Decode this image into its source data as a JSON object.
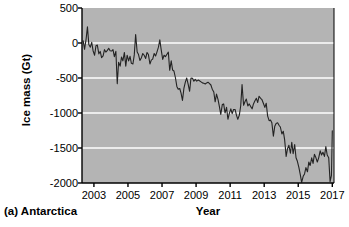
{
  "figure": {
    "caption": "(a) Antarctica",
    "background_color": "#ffffff",
    "plot_background_color": "#b4b4b4",
    "gridline_color": "#ffffff",
    "line_color": "#232323",
    "axis_color": "#000000"
  },
  "chart_data": {
    "type": "line",
    "title": "",
    "subtitle": "",
    "xlabel": "Year",
    "ylabel": "Ice mass (Gt)",
    "xlim": [
      2002.3,
      2017.1
    ],
    "ylim": [
      -2000,
      500
    ],
    "xticks": [
      2003,
      2005,
      2007,
      2009,
      2011,
      2013,
      2015,
      2017
    ],
    "xtick_labels": [
      "2003",
      "2005",
      "2007",
      "2009",
      "2011",
      "2013",
      "2015",
      "2017"
    ],
    "yticks": [
      500,
      0,
      -500,
      -1000,
      -1500,
      -2000
    ],
    "ytick_labels": [
      "500",
      "0",
      "-500",
      "-1000",
      "-1500",
      "-2000"
    ],
    "grid": true,
    "grid_axis": "y",
    "gridlines_at": [
      0,
      -500,
      -1000,
      -1500
    ],
    "legend": null,
    "legend_position": "none",
    "annotations": [
      "(a) Antarctica"
    ],
    "series": [
      {
        "name": "Antarctica ice mass anomaly",
        "units": "Gt",
        "x": [
          2002.37,
          2002.45,
          2002.54,
          2002.62,
          2002.7,
          2002.79,
          2002.87,
          2002.95,
          2003.04,
          2003.12,
          2003.2,
          2003.29,
          2003.37,
          2003.45,
          2003.54,
          2003.62,
          2003.7,
          2003.79,
          2003.87,
          2003.95,
          2004.04,
          2004.12,
          2004.2,
          2004.29,
          2004.37,
          2004.45,
          2004.54,
          2004.62,
          2004.7,
          2004.79,
          2004.87,
          2004.95,
          2005.04,
          2005.12,
          2005.2,
          2005.29,
          2005.37,
          2005.45,
          2005.54,
          2005.62,
          2005.7,
          2005.79,
          2005.87,
          2005.95,
          2006.04,
          2006.12,
          2006.2,
          2006.29,
          2006.37,
          2006.45,
          2006.54,
          2006.62,
          2006.7,
          2006.79,
          2006.87,
          2006.95,
          2007.04,
          2007.12,
          2007.2,
          2007.29,
          2007.37,
          2007.45,
          2007.54,
          2007.62,
          2007.7,
          2007.79,
          2007.87,
          2007.95,
          2008.04,
          2008.12,
          2008.2,
          2008.29,
          2008.37,
          2008.45,
          2008.54,
          2008.62,
          2008.7,
          2008.79,
          2008.87,
          2008.95,
          2009.04,
          2009.12,
          2009.2,
          2009.29,
          2009.37,
          2009.45,
          2009.54,
          2009.62,
          2009.7,
          2009.79,
          2009.87,
          2009.95,
          2010.04,
          2010.12,
          2010.2,
          2010.29,
          2010.37,
          2010.45,
          2010.54,
          2010.62,
          2010.7,
          2010.79,
          2010.87,
          2010.95,
          2011.04,
          2011.12,
          2011.2,
          2011.29,
          2011.37,
          2011.45,
          2011.54,
          2011.62,
          2011.7,
          2011.79,
          2011.87,
          2011.95,
          2012.04,
          2012.12,
          2012.2,
          2012.29,
          2012.37,
          2012.45,
          2012.54,
          2012.62,
          2012.7,
          2012.79,
          2012.87,
          2012.95,
          2013.04,
          2013.12,
          2013.2,
          2013.29,
          2013.37,
          2013.45,
          2013.54,
          2013.62,
          2013.7,
          2013.79,
          2013.87,
          2013.95,
          2014.04,
          2014.12,
          2014.2,
          2014.29,
          2014.37,
          2014.45,
          2014.54,
          2014.62,
          2014.7,
          2014.79,
          2014.87,
          2014.95,
          2015.04,
          2015.12,
          2015.2,
          2015.29,
          2015.37,
          2015.45,
          2015.54,
          2015.62,
          2015.7,
          2015.79,
          2015.87,
          2015.95,
          2016.04,
          2016.12,
          2016.2,
          2016.29,
          2016.37,
          2016.45,
          2016.54,
          2016.62,
          2016.7,
          2016.79,
          2016.87,
          2016.95,
          2017.0
        ],
        "y": [
          30,
          -90,
          55,
          230,
          -20,
          -60,
          10,
          -110,
          -175,
          -40,
          -30,
          -155,
          -120,
          -210,
          -185,
          -95,
          -130,
          -105,
          -75,
          -110,
          -115,
          -95,
          -195,
          -120,
          -580,
          -275,
          -330,
          -200,
          -255,
          -135,
          -330,
          -175,
          -255,
          -190,
          -290,
          -300,
          -170,
          120,
          -130,
          -165,
          -250,
          -210,
          -150,
          -175,
          -220,
          -135,
          -165,
          -300,
          -245,
          -230,
          -150,
          -185,
          -130,
          -60,
          45,
          -95,
          -235,
          -175,
          -195,
          -160,
          -130,
          -390,
          -255,
          -385,
          -400,
          -500,
          -620,
          -660,
          -650,
          -720,
          -820,
          -640,
          -560,
          -500,
          -595,
          -690,
          -500,
          -505,
          -545,
          -520,
          -545,
          -530,
          -540,
          -555,
          -570,
          -575,
          -585,
          -570,
          -560,
          -580,
          -600,
          -660,
          -700,
          -840,
          -730,
          -810,
          -910,
          -1020,
          -880,
          -870,
          -1000,
          -920,
          -1090,
          -1010,
          -940,
          -1010,
          -950,
          -950,
          -1030,
          -1090,
          -1030,
          -900,
          -595,
          -890,
          -840,
          -800,
          -900,
          -870,
          -905,
          -940,
          -870,
          -830,
          -790,
          -850,
          -760,
          -790,
          -810,
          -860,
          -920,
          -860,
          -1040,
          -1110,
          -1100,
          -1140,
          -1330,
          -1190,
          -1150,
          -1140,
          -1175,
          -1200,
          -1300,
          -1260,
          -1380,
          -1620,
          -1510,
          -1460,
          -1575,
          -1420,
          -1580,
          -1450,
          -1640,
          -1690,
          -1780,
          -1880,
          -1990,
          -1905,
          -1870,
          -1780,
          -1840,
          -1700,
          -1750,
          -1640,
          -1720,
          -1590,
          -1640,
          -1700,
          -1640,
          -1540,
          -1600,
          -1560,
          -1620,
          -1480,
          -1600,
          -1640,
          -1980,
          -1890,
          -1255
        ]
      }
    ]
  }
}
